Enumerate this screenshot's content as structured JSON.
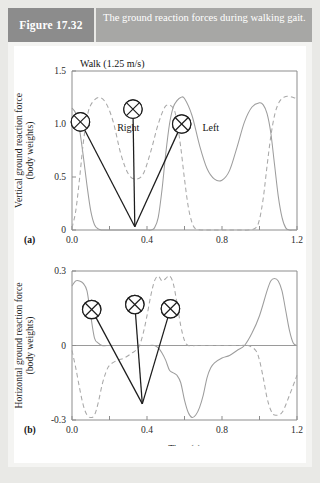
{
  "header": {
    "figure_tag": "Figure 17.32",
    "caption": "The ground reaction forces during walking gait."
  },
  "footer_text": "",
  "panels": {
    "a": {
      "panel_label": "(a)",
      "condition_label": "Walk (1.25 m/s)",
      "ylabel_line1": "Vertical ground reaction force",
      "ylabel_line2": "(body weights)",
      "yticks": [
        "1.5",
        "1.0",
        "0.5",
        "0"
      ],
      "xticks": [
        "0.0",
        "0.4",
        "0.8",
        "1.2"
      ],
      "series_label_right": "Right",
      "series_label_left": "Left"
    },
    "b": {
      "panel_label": "(b)",
      "ylabel_line1": "Horizontal ground reaction force",
      "ylabel_line2": "(body weights)",
      "yticks": [
        "0.3",
        "0",
        "-0.3"
      ],
      "xticks": [
        "0.0",
        "0.4",
        "0.8",
        "1.2"
      ],
      "xlabel": "Time (s)"
    }
  },
  "chart_data": [
    {
      "type": "line",
      "title": "Walk (1.25 m/s)",
      "xlabel": "Time (s)",
      "ylabel": "Vertical ground reaction force (body weights)",
      "xlim": [
        0.0,
        1.2
      ],
      "ylim": [
        0.0,
        1.5
      ],
      "xtick_values": [
        0.0,
        0.2,
        0.4,
        0.6,
        0.8,
        1.0,
        1.2
      ],
      "xtick_labels": [
        "0.0",
        "",
        "0.4",
        "",
        "0.8",
        "",
        "1.2"
      ],
      "ytick_values": [
        0.0,
        0.5,
        1.0,
        1.5
      ],
      "ytick_labels": [
        "0",
        "0.5",
        "1.0",
        "1.5"
      ],
      "grid": false,
      "legend": "inline-annotation",
      "panel": "(a)",
      "series": [
        {
          "name": "Left",
          "style": "solid",
          "color": "#9d9d9d",
          "x": [
            0.0,
            0.02,
            0.04,
            0.06,
            0.08,
            0.1,
            0.12,
            0.14,
            0.16,
            0.18,
            0.2,
            0.22,
            0.24,
            0.26,
            0.28,
            0.3,
            0.32,
            0.34,
            0.36,
            0.38,
            0.4,
            0.42,
            0.44,
            0.46,
            0.48,
            0.5,
            0.52,
            0.54,
            0.56,
            0.58,
            0.6,
            0.64,
            0.68,
            0.72,
            0.76,
            0.8,
            0.84,
            0.88,
            0.92,
            0.96,
            1.0,
            1.02,
            1.04,
            1.06,
            1.08,
            1.1,
            1.12,
            1.14,
            1.16,
            1.18,
            1.2
          ],
          "y": [
            1.15,
            1.1,
            0.95,
            0.7,
            0.42,
            0.18,
            0.05,
            0.01,
            0.0,
            0.0,
            0.0,
            0.0,
            0.0,
            0.0,
            0.0,
            0.0,
            0.0,
            0.0,
            0.0,
            0.0,
            0.0,
            0.0,
            0.02,
            0.12,
            0.38,
            0.72,
            1.0,
            1.16,
            1.22,
            1.25,
            1.24,
            1.08,
            0.8,
            0.58,
            0.48,
            0.47,
            0.56,
            0.78,
            1.02,
            1.16,
            1.2,
            1.18,
            1.1,
            0.92,
            0.62,
            0.32,
            0.12,
            0.02,
            0.0,
            0.0,
            0.0
          ]
        },
        {
          "name": "Right",
          "style": "dashed",
          "color": "#a8a8a8",
          "x": [
            0.0,
            0.02,
            0.04,
            0.06,
            0.08,
            0.1,
            0.14,
            0.18,
            0.22,
            0.26,
            0.3,
            0.34,
            0.38,
            0.42,
            0.46,
            0.5,
            0.54,
            0.56,
            0.58,
            0.6,
            0.62,
            0.64,
            0.66,
            0.7,
            0.74,
            0.78,
            0.82,
            0.86,
            0.9,
            0.94,
            0.98,
            1.0,
            1.02,
            1.04,
            1.06,
            1.08,
            1.1,
            1.12,
            1.14,
            1.16,
            1.18,
            1.2
          ],
          "y": [
            0.02,
            0.18,
            0.48,
            0.82,
            1.06,
            1.18,
            1.25,
            1.2,
            1.02,
            0.72,
            0.53,
            0.48,
            0.53,
            0.74,
            1.0,
            1.17,
            1.15,
            1.02,
            0.78,
            0.48,
            0.22,
            0.07,
            0.01,
            0.0,
            0.0,
            0.0,
            0.0,
            0.0,
            0.0,
            0.0,
            0.02,
            0.1,
            0.3,
            0.6,
            0.88,
            1.08,
            1.19,
            1.24,
            1.26,
            1.26,
            1.25,
            1.24
          ]
        }
      ],
      "annotations": [
        {
          "label": "Right",
          "type": "text",
          "x": 0.3,
          "y": 0.93
        },
        {
          "label": "Left",
          "type": "text",
          "x": 0.74,
          "y": 0.93
        },
        {
          "label": "foot-contact-marker",
          "type": "marker",
          "marker_x": 0.045,
          "marker_y": 1.02,
          "target_x": 0.335,
          "target_y": 0.03
        },
        {
          "label": "foot-contact-marker",
          "type": "marker",
          "marker_x": 0.325,
          "marker_y": 1.14,
          "target_x": 0.335,
          "target_y": 0.03
        },
        {
          "label": "foot-contact-marker",
          "type": "marker",
          "marker_x": 0.585,
          "marker_y": 1.0,
          "target_x": 0.335,
          "target_y": 0.03
        }
      ]
    },
    {
      "type": "line",
      "title": "",
      "xlabel": "Time (s)",
      "ylabel": "Horizontal ground reaction force (body weights)",
      "xlim": [
        0.0,
        1.2
      ],
      "ylim": [
        -0.3,
        0.3
      ],
      "xtick_values": [
        0.0,
        0.2,
        0.4,
        0.6,
        0.8,
        1.0,
        1.2
      ],
      "xtick_labels": [
        "0.0",
        "",
        "0.4",
        "",
        "0.8",
        "",
        "1.2"
      ],
      "ytick_values": [
        -0.3,
        0.0,
        0.3
      ],
      "ytick_labels": [
        "-0.3",
        "0",
        "0.3"
      ],
      "grid": false,
      "panel": "(b)",
      "series": [
        {
          "name": "Left",
          "style": "solid",
          "color": "#9d9d9d",
          "x": [
            0.0,
            0.02,
            0.04,
            0.06,
            0.08,
            0.1,
            0.12,
            0.14,
            0.16,
            0.2,
            0.24,
            0.28,
            0.32,
            0.36,
            0.4,
            0.44,
            0.46,
            0.48,
            0.5,
            0.52,
            0.54,
            0.56,
            0.58,
            0.6,
            0.62,
            0.64,
            0.66,
            0.68,
            0.7,
            0.72,
            0.74,
            0.76,
            0.8,
            0.84,
            0.88,
            0.92,
            0.96,
            1.0,
            1.04,
            1.06,
            1.08,
            1.1,
            1.12,
            1.14,
            1.16,
            1.18,
            1.2
          ],
          "y": [
            0.24,
            0.26,
            0.26,
            0.25,
            0.22,
            0.12,
            0.03,
            0.01,
            0.0,
            0.0,
            0.0,
            0.0,
            0.0,
            0.0,
            0.0,
            0.0,
            -0.01,
            -0.03,
            -0.06,
            -0.1,
            -0.11,
            -0.12,
            -0.15,
            -0.22,
            -0.27,
            -0.29,
            -0.28,
            -0.25,
            -0.2,
            -0.13,
            -0.09,
            -0.07,
            -0.05,
            -0.04,
            -0.02,
            0.0,
            0.05,
            0.12,
            0.22,
            0.26,
            0.27,
            0.26,
            0.22,
            0.14,
            0.06,
            0.01,
            0.0
          ]
        },
        {
          "name": "Right",
          "style": "dashed",
          "color": "#a8a8a8",
          "x": [
            0.0,
            0.02,
            0.04,
            0.06,
            0.08,
            0.1,
            0.12,
            0.14,
            0.16,
            0.18,
            0.2,
            0.24,
            0.28,
            0.32,
            0.34,
            0.36,
            0.38,
            0.4,
            0.42,
            0.44,
            0.46,
            0.48,
            0.5,
            0.52,
            0.54,
            0.56,
            0.58,
            0.6,
            0.62,
            0.66,
            0.7,
            0.74,
            0.78,
            0.82,
            0.86,
            0.9,
            0.94,
            0.98,
            1.0,
            1.02,
            1.04,
            1.06,
            1.08,
            1.12,
            1.16,
            1.2
          ],
          "y": [
            -0.02,
            -0.09,
            -0.17,
            -0.24,
            -0.28,
            -0.29,
            -0.28,
            -0.23,
            -0.16,
            -0.11,
            -0.08,
            -0.06,
            -0.05,
            -0.03,
            -0.02,
            0.0,
            0.05,
            0.12,
            0.2,
            0.26,
            0.28,
            0.26,
            0.27,
            0.28,
            0.25,
            0.17,
            0.08,
            0.02,
            0.0,
            0.0,
            0.0,
            0.0,
            0.0,
            0.0,
            0.0,
            0.0,
            0.0,
            -0.02,
            -0.06,
            -0.13,
            -0.21,
            -0.26,
            -0.28,
            -0.27,
            -0.2,
            -0.12
          ]
        }
      ],
      "annotations": [
        {
          "label": "foot-contact-marker",
          "type": "marker",
          "marker_x": 0.105,
          "marker_y": 0.145,
          "target_x": 0.375,
          "target_y": -0.235
        },
        {
          "label": "foot-contact-marker",
          "type": "marker",
          "marker_x": 0.335,
          "marker_y": 0.165,
          "target_x": 0.375,
          "target_y": -0.235
        },
        {
          "label": "foot-contact-marker",
          "type": "marker",
          "marker_x": 0.525,
          "marker_y": 0.148,
          "target_x": 0.375,
          "target_y": -0.235
        }
      ]
    }
  ]
}
